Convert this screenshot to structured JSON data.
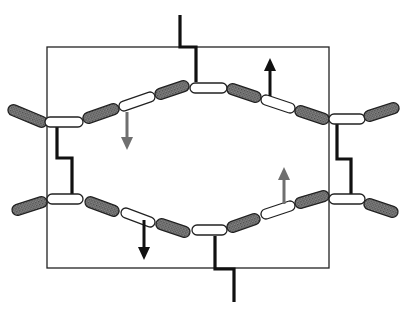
{
  "diagram": {
    "colors": {
      "background": "#ffffff",
      "box_stroke": "#222222",
      "linker": "#111111",
      "shaded_segment": "#777777",
      "shaded_outline": "#222222",
      "white_segment": "#ffffff",
      "arrow_black": "#111111",
      "arrow_gray": "#6f6f6f"
    },
    "box": {
      "x": 47,
      "y": 47,
      "width": 282,
      "height": 221
    },
    "top_chain": {
      "segments": [
        {
          "type": "shaded",
          "x1": 13,
          "y1": 110,
          "x2": 42,
          "y2": 122
        },
        {
          "type": "white",
          "x1": 50,
          "y1": 122,
          "x2": 78,
          "y2": 122
        },
        {
          "type": "shaded",
          "x1": 88,
          "y1": 118,
          "x2": 114,
          "y2": 109
        },
        {
          "type": "white",
          "x1": 124,
          "y1": 106,
          "x2": 150,
          "y2": 97
        },
        {
          "type": "shaded",
          "x1": 160,
          "y1": 94,
          "x2": 184,
          "y2": 86
        },
        {
          "type": "white",
          "x1": 195,
          "y1": 88,
          "x2": 222,
          "y2": 88
        },
        {
          "type": "shaded",
          "x1": 232,
          "y1": 89,
          "x2": 256,
          "y2": 97
        },
        {
          "type": "white",
          "x1": 266,
          "y1": 100,
          "x2": 290,
          "y2": 108
        },
        {
          "type": "shaded",
          "x1": 300,
          "y1": 111,
          "x2": 324,
          "y2": 119
        },
        {
          "type": "white",
          "x1": 334,
          "y1": 119,
          "x2": 360,
          "y2": 119
        },
        {
          "type": "shaded",
          "x1": 369,
          "y1": 116,
          "x2": 394,
          "y2": 108
        }
      ]
    },
    "bottom_chain": {
      "segments": [
        {
          "type": "shaded",
          "x1": 17,
          "y1": 210,
          "x2": 42,
          "y2": 202
        },
        {
          "type": "white",
          "x1": 52,
          "y1": 199,
          "x2": 78,
          "y2": 199
        },
        {
          "type": "shaded",
          "x1": 90,
          "y1": 202,
          "x2": 114,
          "y2": 211
        },
        {
          "type": "white",
          "x1": 126,
          "y1": 213,
          "x2": 150,
          "y2": 222
        },
        {
          "type": "shaded",
          "x1": 161,
          "y1": 224,
          "x2": 185,
          "y2": 232
        },
        {
          "type": "white",
          "x1": 197,
          "y1": 230,
          "x2": 222,
          "y2": 230
        },
        {
          "type": "shaded",
          "x1": 232,
          "y1": 227,
          "x2": 255,
          "y2": 219
        },
        {
          "type": "white",
          "x1": 266,
          "y1": 214,
          "x2": 290,
          "y2": 206
        },
        {
          "type": "shaded",
          "x1": 300,
          "y1": 203,
          "x2": 324,
          "y2": 196
        },
        {
          "type": "white",
          "x1": 334,
          "y1": 199,
          "x2": 360,
          "y2": 199
        },
        {
          "type": "shaded",
          "x1": 369,
          "y1": 204,
          "x2": 393,
          "y2": 212
        }
      ]
    },
    "linkers": [
      {
        "name": "top-linker",
        "points": "180,15 180,47 196,47 196,82"
      },
      {
        "name": "left-linker",
        "points": "57,127 57,158 72,158 72,194"
      },
      {
        "name": "right-linker",
        "points": "337,124 337,159 351,159 351,194"
      },
      {
        "name": "bottom-linker",
        "points": "215,236 215,269 234,269 234,302"
      }
    ],
    "arrows": [
      {
        "name": "arrow-down-gray",
        "color": "gray",
        "x": 127,
        "y1": 112,
        "y2": 150,
        "direction": "down"
      },
      {
        "name": "arrow-up-black",
        "color": "black",
        "x": 270,
        "y1": 96,
        "y2": 58,
        "direction": "up"
      },
      {
        "name": "arrow-down-black",
        "color": "black",
        "x": 144,
        "y1": 220,
        "y2": 260,
        "direction": "down"
      },
      {
        "name": "arrow-up-gray",
        "color": "gray",
        "x": 284,
        "y1": 204,
        "y2": 167,
        "direction": "up"
      }
    ]
  }
}
